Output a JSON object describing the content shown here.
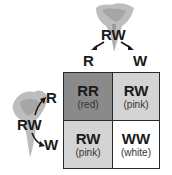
{
  "top_parent": {
    "genotype": "RW",
    "gametes": [
      "R",
      "W"
    ]
  },
  "left_parent": {
    "genotype": "RW",
    "gametes": [
      "R",
      "W"
    ]
  },
  "grid": {
    "cells": [
      {
        "genotype": "RR",
        "phenotype": "(red)",
        "color": "#8a8a8a"
      },
      {
        "genotype": "RW",
        "phenotype": "(pink)",
        "color": "#d4d4d4"
      },
      {
        "genotype": "RW",
        "phenotype": "(pink)",
        "color": "#d4d4d4"
      },
      {
        "genotype": "WW",
        "phenotype": "(white)",
        "color": "#ffffff"
      }
    ]
  }
}
